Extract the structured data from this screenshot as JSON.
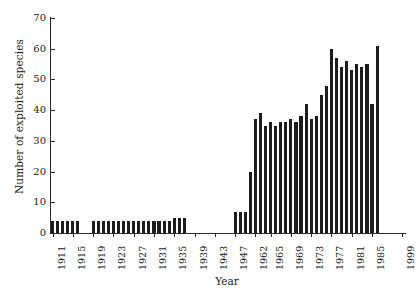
{
  "chart_data": {
    "type": "bar",
    "title": "",
    "xlabel": "Year",
    "ylabel": "Number of exploited species",
    "ylim": [
      0,
      70
    ],
    "ytick_values": [
      0,
      10,
      20,
      30,
      40,
      50,
      60,
      70
    ],
    "ytick_labels": [
      "0",
      "10",
      "20",
      "30",
      "40",
      "50",
      "60",
      "70"
    ],
    "grid": false,
    "legend": "none",
    "bar_color": "#1c1c1c",
    "xtick_labels": [
      "1911",
      "1915",
      "1919",
      "1923",
      "1927",
      "1931",
      "1935",
      "1939",
      "1943",
      "1947",
      "1962",
      "1965",
      "1969",
      "1973",
      "1977",
      "1981",
      "1985",
      "1999"
    ],
    "xtick_indices": [
      0,
      4,
      8,
      12,
      16,
      20,
      24,
      28,
      32,
      36,
      40,
      43,
      47,
      51,
      55,
      59,
      63,
      69
    ],
    "categories": [
      "1911",
      "1912",
      "1913",
      "1914",
      "1915",
      "1916",
      "1917",
      "1918",
      "1919",
      "1920",
      "1921",
      "1922",
      "1923",
      "1924",
      "1925",
      "1926",
      "1927",
      "1928",
      "1929",
      "1930",
      "1931",
      "1932",
      "1933",
      "1934",
      "1935",
      "1936",
      "1937",
      "1938",
      "1939",
      "1940",
      "1941",
      "1942",
      "1943",
      "1944",
      "1945",
      "1946",
      "1947",
      "1948",
      "1949",
      "1950",
      "1962",
      "1963",
      "1964",
      "1965",
      "1966",
      "1967",
      "1968",
      "1969",
      "1970",
      "1971",
      "1972",
      "1973",
      "1974",
      "1975",
      "1976",
      "1977",
      "1978",
      "1979",
      "1980",
      "1981",
      "1982",
      "1983",
      "1984",
      "1985",
      "1986",
      "1987",
      "1988",
      "1989",
      "1990",
      "1999"
    ],
    "values": [
      4,
      4,
      4,
      4,
      4,
      4,
      0,
      0,
      4,
      4,
      4,
      4,
      4,
      4,
      4,
      4,
      4,
      4,
      4,
      4,
      4,
      4,
      4,
      4,
      5,
      5,
      5,
      0,
      0,
      0,
      0,
      0,
      0,
      0,
      0,
      0,
      7,
      7,
      7,
      20,
      37,
      39,
      35,
      36,
      35,
      36,
      36,
      37,
      36,
      38,
      42,
      37,
      38,
      45,
      48,
      60,
      57,
      54,
      56,
      53,
      55,
      54,
      55,
      42,
      61,
      0,
      0,
      0,
      0,
      0
    ]
  }
}
